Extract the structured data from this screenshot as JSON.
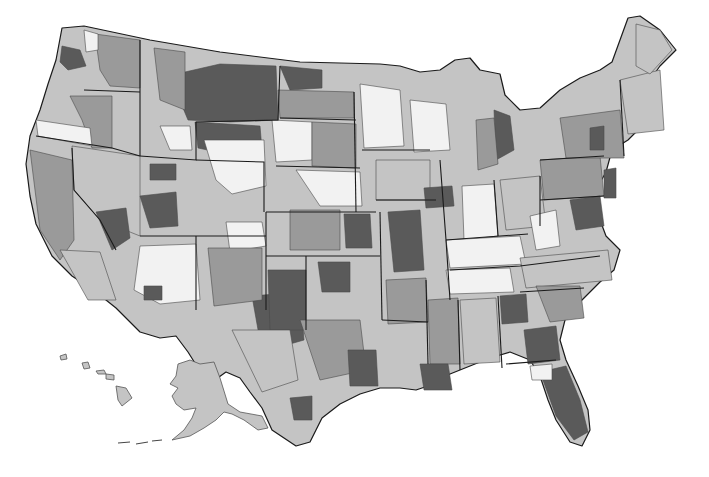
{
  "map": {
    "type": "choropleth",
    "subject": "United States sub-state regions",
    "grayscale_levels": {
      "level_1": "#f2f2f2",
      "level_2": "#c4c4c4",
      "level_3": "#9a9a9a",
      "level_4": "#5a5a5a"
    },
    "border_color": "#1a1a1a",
    "background": "#ffffff",
    "insets": [
      "Alaska",
      "Hawaii"
    ]
  }
}
